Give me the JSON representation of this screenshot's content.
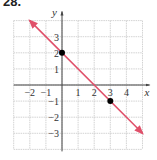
{
  "problem_number": "28.",
  "chart_data": {
    "type": "line",
    "title": "",
    "xlabel": "x",
    "ylabel": "y",
    "xlim": [
      -3,
      5
    ],
    "ylim": [
      -4,
      4
    ],
    "grid": true,
    "x_tick_labels": [
      "−2",
      "−1",
      "1",
      "2",
      "3",
      "4"
    ],
    "x_ticks": [
      -2,
      -1,
      1,
      2,
      3,
      4
    ],
    "y_tick_labels": [
      "3",
      "2",
      "1",
      "−1",
      "−2",
      "−3"
    ],
    "y_ticks": [
      3,
      2,
      1,
      -1,
      -2,
      -3
    ],
    "series": [
      {
        "name": "line",
        "equation": "y = -x + 2",
        "x": [
          -2,
          5
        ],
        "y": [
          4,
          -3
        ],
        "color": "#e0506a",
        "arrows": "both"
      }
    ],
    "points": [
      {
        "x": 0,
        "y": 2,
        "color": "#000000"
      },
      {
        "x": 3,
        "y": -1,
        "color": "#000000"
      }
    ]
  },
  "colors": {
    "line": "#e0506a",
    "grid": "#c8c8c8",
    "axis": "#444444",
    "point": "#000000"
  }
}
